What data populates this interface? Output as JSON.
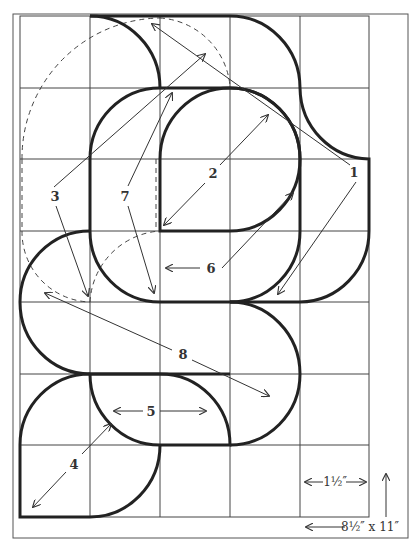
{
  "diagram": {
    "grid": {
      "columns": 5,
      "rows": 7,
      "cell_size_label": "1½″"
    },
    "paper_size_label": "8½″ x 11″",
    "piece_labels": [
      {
        "id": "1",
        "text": "1"
      },
      {
        "id": "2",
        "text": "2"
      },
      {
        "id": "3",
        "text": "3"
      },
      {
        "id": "4",
        "text": "4"
      },
      {
        "id": "5",
        "text": "5"
      },
      {
        "id": "6",
        "text": "6"
      },
      {
        "id": "7",
        "text": "7"
      },
      {
        "id": "8",
        "text": "8"
      }
    ],
    "colors": {
      "background": "#ffffff",
      "line": "#222222",
      "grid": "#444444"
    }
  }
}
